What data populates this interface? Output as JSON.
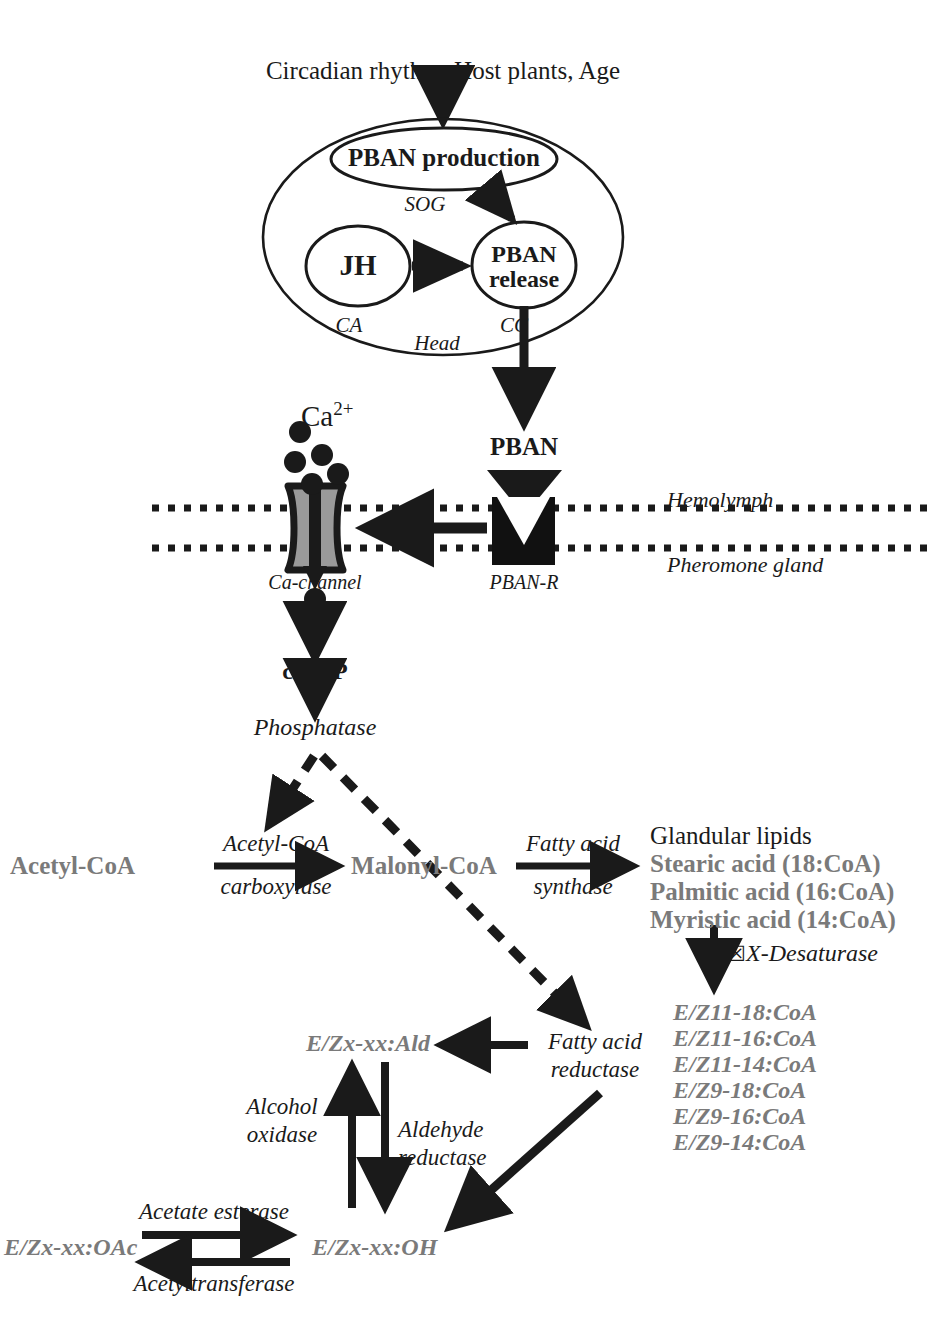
{
  "figure": {
    "type": "pathway-diagram",
    "topic": "Moth sex pheromone biosynthesis pathway regulated by PBAN"
  },
  "top": {
    "stimuli": "Circadian rhythm, Host plants, Age"
  },
  "head": {
    "region_label": "Head",
    "pban_production": "PBAN production",
    "jh": "JH",
    "pban_release": "PBAN release",
    "pban_release_line1": "PBAN",
    "pban_release_line2": "release",
    "sog": "SOG",
    "ca": "CA",
    "cc": "CC"
  },
  "membrane": {
    "calcium": "Ca",
    "calcium_charge": "2+",
    "ca_channel": "Ca-channel",
    "pban": "PBAN",
    "pban_receptor": "PBAN-R",
    "hemolymph": "Hemolymph",
    "pheromone_gland": "Pheromone gland"
  },
  "signaling": {
    "camp": "cAMP",
    "phosphatase": "Phosphatase"
  },
  "fatty_acid_row": {
    "acetyl_coa": "Acetyl-CoA",
    "acetyl_coa_carboxylase_line1": "Acetyl-CoA",
    "acetyl_coa_carboxylase_line2": "carboxylase",
    "malonyl_coa": "Malonyl-CoA",
    "fatty_acid_synthase_line1": "Fatty acid",
    "fatty_acid_synthase_line2": "synthase"
  },
  "glandular_lipids": {
    "heading": "Glandular lipids",
    "items": [
      "Stearic acid (18:CoA)",
      "Palmitic acid (16:CoA)",
      "Myristic acid (14:CoA)"
    ]
  },
  "desaturase": {
    "glyph": "☒",
    "label": "X-Desaturase"
  },
  "coa_products": [
    "E/Z11-18:CoA",
    "E/Z11-16:CoA",
    "E/Z11-14:CoA",
    "E/Z9-18:CoA",
    "E/Z9-16:CoA",
    "E/Z9-14:CoA"
  ],
  "lower": {
    "aldehyde": "E/Zx-xx:Ald",
    "alcohol": "E/Zx-xx:OH",
    "acetate": "E/Zx-xx:OAc",
    "fatty_acid_reductase_line1": "Fatty acid",
    "fatty_acid_reductase_line2": "reductase",
    "alcohol_oxidase_line1": "Alcohol",
    "alcohol_oxidase_line2": "oxidase",
    "aldehyde_reductase_line1": "Aldehyde",
    "aldehyde_reductase_line2": "reductase",
    "acetate_esterase": "Acetate esterase",
    "acetyltransferase": "Acetyltransferase"
  },
  "colors": {
    "ink": "#1a1a1a",
    "gray_text": "#7a7a7a",
    "channel_fill": "#9a9a9a",
    "receptor_fill": "#111111",
    "white": "#ffffff"
  }
}
